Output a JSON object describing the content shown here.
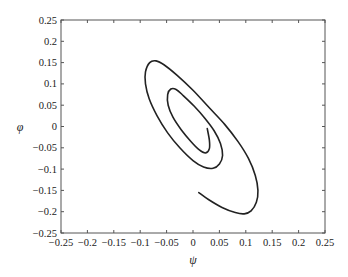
{
  "chart_data": {
    "type": "line",
    "title": "",
    "xlabel": "ψ",
    "ylabel": "φ",
    "xlim": [
      -0.25,
      0.25
    ],
    "ylim": [
      -0.25,
      0.25
    ],
    "grid": false,
    "legend": null,
    "xticks": [
      -0.25,
      -0.2,
      -0.15,
      -0.1,
      -0.05,
      0,
      0.05,
      0.1,
      0.15,
      0.2,
      0.25
    ],
    "xtick_labels": [
      "−0.25",
      "−0.2",
      "−0.15",
      "−0.1",
      "−0.05",
      "0",
      "0.05",
      "0.1",
      "0.15",
      "0.2",
      "0.25"
    ],
    "yticks": [
      0.25,
      0.2,
      0.15,
      0.1,
      0.05,
      0,
      -0.05,
      -0.1,
      -0.15,
      -0.2,
      -0.25
    ],
    "ytick_labels": [
      "0.25",
      "0.2",
      "0.15",
      "0.1",
      "0.05",
      "0",
      "−0.05",
      "−0.1",
      "−0.15",
      "−0.2",
      "−0.25"
    ],
    "series": [
      {
        "name": "trajectory",
        "color": "#222222",
        "points": [
          [
            0.011,
            -0.155
          ],
          [
            0.03,
            -0.172
          ],
          [
            0.055,
            -0.19
          ],
          [
            0.08,
            -0.202
          ],
          [
            0.097,
            -0.205
          ],
          [
            0.11,
            -0.198
          ],
          [
            0.12,
            -0.178
          ],
          [
            0.123,
            -0.15
          ],
          [
            0.118,
            -0.115
          ],
          [
            0.105,
            -0.075
          ],
          [
            0.085,
            -0.035
          ],
          [
            0.06,
            0.005
          ],
          [
            0.03,
            0.045
          ],
          [
            0.0,
            0.085
          ],
          [
            -0.03,
            0.12
          ],
          [
            -0.055,
            0.145
          ],
          [
            -0.07,
            0.154
          ],
          [
            -0.082,
            0.15
          ],
          [
            -0.09,
            0.128
          ],
          [
            -0.09,
            0.1
          ],
          [
            -0.083,
            0.065
          ],
          [
            -0.068,
            0.025
          ],
          [
            -0.048,
            -0.015
          ],
          [
            -0.025,
            -0.05
          ],
          [
            0.0,
            -0.08
          ],
          [
            0.02,
            -0.095
          ],
          [
            0.038,
            -0.098
          ],
          [
            0.05,
            -0.088
          ],
          [
            0.056,
            -0.068
          ],
          [
            0.052,
            -0.04
          ],
          [
            0.04,
            -0.01
          ],
          [
            0.022,
            0.02
          ],
          [
            0.002,
            0.048
          ],
          [
            -0.018,
            0.072
          ],
          [
            -0.032,
            0.087
          ],
          [
            -0.042,
            0.088
          ],
          [
            -0.048,
            0.075
          ],
          [
            -0.047,
            0.05
          ],
          [
            -0.038,
            0.022
          ],
          [
            -0.022,
            -0.008
          ],
          [
            -0.004,
            -0.035
          ],
          [
            0.012,
            -0.055
          ],
          [
            0.024,
            -0.062
          ],
          [
            0.031,
            -0.052
          ],
          [
            0.031,
            -0.032
          ],
          [
            0.027,
            -0.005
          ]
        ]
      }
    ]
  }
}
